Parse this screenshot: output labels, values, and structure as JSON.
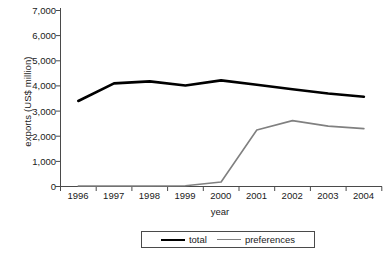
{
  "chart_data": {
    "type": "line",
    "title": "",
    "xlabel": "year",
    "ylabel": "exports (US$ million)",
    "categories": [
      "1996",
      "1997",
      "1998",
      "1999",
      "2000",
      "2001",
      "2002",
      "2003",
      "2004"
    ],
    "x": [
      1996,
      1997,
      1998,
      1999,
      2000,
      2001,
      2002,
      2003,
      2004
    ],
    "xlim": [
      1996,
      2004
    ],
    "ylim": [
      0,
      7000
    ],
    "ytick_labels": [
      "0",
      "1,000",
      "2,000",
      "3,000",
      "4,000",
      "5,000",
      "6,000",
      "7,000"
    ],
    "ytick_values": [
      0,
      1000,
      2000,
      3000,
      4000,
      5000,
      6000,
      7000
    ],
    "grid": false,
    "legend_position": "bottom",
    "series": [
      {
        "name": "total",
        "color": "#000000",
        "width": 2.6,
        "values": [
          3400,
          4100,
          4180,
          4020,
          4220,
          4050,
          3870,
          3700,
          3570
        ]
      },
      {
        "name": "preferences",
        "color": "#808080",
        "width": 1.6,
        "values": [
          20,
          20,
          20,
          30,
          180,
          2250,
          2620,
          2400,
          2300
        ]
      }
    ]
  },
  "legend": {
    "items": [
      {
        "label": "total"
      },
      {
        "label": "preferences"
      }
    ]
  },
  "axes": {
    "y_axis_name": "y-axis",
    "x_axis_name": "x-axis"
  }
}
